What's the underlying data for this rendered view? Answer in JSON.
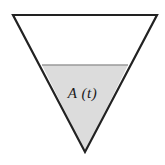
{
  "figure": {
    "caption_label": "A (t)",
    "background_color": "#ffffff",
    "outline_color": "#222222",
    "outline_width_px": 2.2,
    "fill_color": "#dcdcdc",
    "waterline_color": "#9a9a9a",
    "shape": {
      "type": "inverted-triangle",
      "description": "downward-pointing triangular tank cross-section",
      "vertices": [
        {
          "name": "top-left",
          "x": 13,
          "y": 15
        },
        {
          "name": "top-right",
          "x": 157,
          "y": 15
        },
        {
          "name": "apex-bottom",
          "x": 85,
          "y": 152
        }
      ]
    },
    "filled_region": {
      "name": "A (t)",
      "description": "shaded liquid region bounded above by the horizontal waterline and below by the triangle apex",
      "waterline": {
        "y": 65,
        "x_left": 42,
        "x_right": 128
      },
      "vertices": [
        {
          "x": 42,
          "y": 65
        },
        {
          "x": 128,
          "y": 65
        },
        {
          "x": 85,
          "y": 152
        }
      ]
    },
    "label_position": {
      "x": 85,
      "y": 93
    }
  }
}
